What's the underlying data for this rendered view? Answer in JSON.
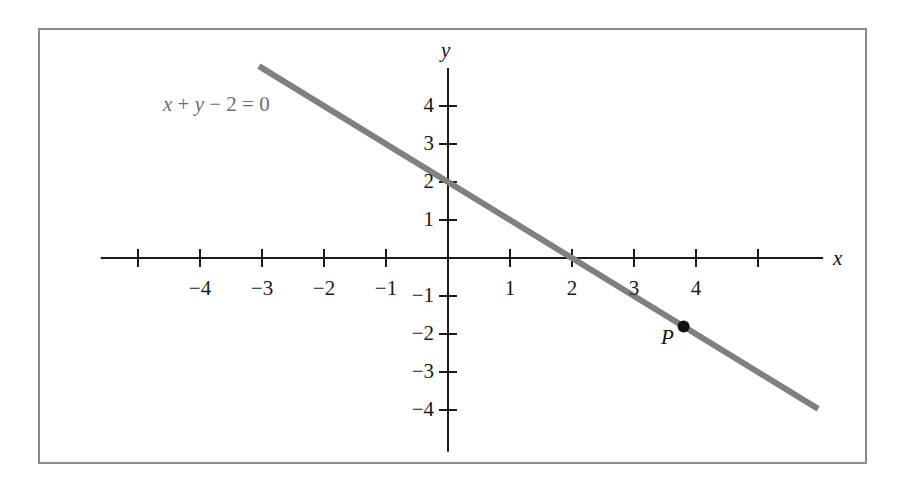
{
  "figure": {
    "background_color": "#ffffff",
    "frame_color": "#8a8a8a",
    "axis_color": "#1a1a1a",
    "line_color": "#808080",
    "point_color": "#111111",
    "equation_color": "#6e6e6e"
  },
  "annotations": {
    "equation_x": "x",
    "equation_plus": " + ",
    "equation_y": "y",
    "equation_rest": " − 2 = 0",
    "equation_full": "x + y − 2 = 0",
    "point_label": "P",
    "x_axis_label": "x",
    "y_axis_label": "y"
  },
  "chart_data": {
    "type": "line",
    "title": "",
    "subtitle": "",
    "xlabel": "x",
    "ylabel": "y",
    "xlim": [
      -5.6,
      6.05
    ],
    "ylim": [
      -5.1,
      5.0
    ],
    "grid": false,
    "legend": null,
    "x_ticks": [
      -5,
      -4,
      -3,
      -2,
      -1,
      1,
      2,
      3,
      4,
      5
    ],
    "x_tick_labels": [
      "",
      "−4",
      "−3",
      "−2",
      "−1",
      "1",
      "2",
      "3",
      "4",
      ""
    ],
    "y_ticks": [
      4,
      3,
      2,
      1,
      -1,
      -2,
      -3,
      -4
    ],
    "y_tick_labels": [
      "4",
      "3",
      "2",
      "1",
      "−1",
      "−2",
      "−3",
      "−4"
    ],
    "series": [
      {
        "name": "x + y − 2 = 0",
        "equation": "y = -x + 2",
        "slope": -1,
        "intercept": 2,
        "x_intercept": 2,
        "y_intercept": 2,
        "endpoints": [
          {
            "x": -3.05,
            "y": 5.05
          },
          {
            "x": 5.97,
            "y": -3.97
          }
        ],
        "color": "#808080",
        "width": 6
      }
    ],
    "points": [
      {
        "label": "P",
        "x": 3.8,
        "y": -1.8,
        "color": "#111111",
        "radius": 6
      }
    ]
  }
}
